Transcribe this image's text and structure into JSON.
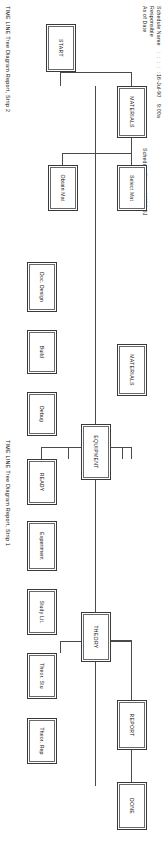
{
  "report": {
    "header": {
      "labels": [
        "Schedule Name",
        "Responsible",
        "As of Date"
      ],
      "dots": ": : : : :",
      "date": "16-Jul-90",
      "time": "9:00a",
      "schedule_file_label": "Schedule File :",
      "schedule_file_value": "MSPROJ"
    },
    "captions": {
      "strip1": "TIME LINE Tree Diagram Report, Strip 1",
      "strip2": "TIME LINE Tree Diagram Report, Strip 2"
    },
    "nodes": {
      "start": "START",
      "materials_top": "MATERIALS",
      "materials_mid": "MATERIALS",
      "equipment": "EQUIPMENT",
      "theory": "THEORY",
      "report": "REPORT",
      "done": "DONE",
      "select_mat": "Select Mat",
      "obtain_mat": "Obtain Mat",
      "doc_design": "Doc. Design",
      "build": "Build",
      "debug": "Debug",
      "ready": "READY",
      "experiment": "Experiment",
      "study_lit": "Study Lit.",
      "theor_stu": "Theor. Stu",
      "theor_rep": "Theor. Rep"
    },
    "colors": {
      "box_border": "#3a3a3a",
      "inner_border": "#6a6a6a",
      "line": "#4a4a4a",
      "text": "#111111",
      "background": "#ffffff"
    }
  }
}
